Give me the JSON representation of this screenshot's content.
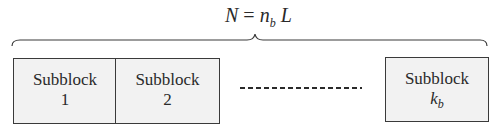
{
  "formula": {
    "lhs": "N",
    "eq": " = ",
    "n": "n",
    "sub": "b",
    "L": " L"
  },
  "blocks": [
    {
      "label": "Subblock",
      "index": "1"
    },
    {
      "label": "Subblock",
      "index": "2"
    },
    {
      "label": "Subblock",
      "index": "k",
      "index_sub": "b"
    }
  ],
  "colors": {
    "box_fill": "#f2f2f2",
    "stroke": "#3a3a3a"
  }
}
